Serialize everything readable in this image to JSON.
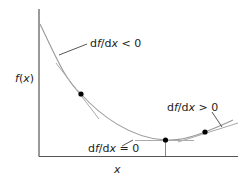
{
  "diagram": {
    "title": "",
    "y_axis_label": "f(x)",
    "x_axis_label": "x",
    "annotations": [
      {
        "id": "neg",
        "label": "df/dx < 0",
        "df": "df/d",
        "x": "x",
        "rel": " < 0"
      },
      {
        "id": "zero",
        "label": "df/dx = 0",
        "df": "df/d",
        "x": "x",
        "rel": " = 0"
      },
      {
        "id": "pos",
        "label": "df/dx > 0",
        "df": "df/d",
        "x": "x",
        "rel": " > 0"
      }
    ],
    "points": [
      {
        "name": "point-negative-slope",
        "x": 81,
        "y": 94
      },
      {
        "name": "point-minimum",
        "x": 165,
        "y": 140
      },
      {
        "name": "point-positive-slope",
        "x": 205,
        "y": 132
      }
    ],
    "colors": {
      "axis": "#555555",
      "curve": "#999999",
      "tangent": "#aaaaaa",
      "leader": "#555555",
      "point": "#000000",
      "text": "#222222"
    }
  }
}
